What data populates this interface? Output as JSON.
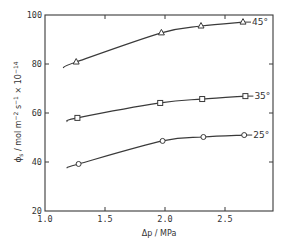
{
  "chart_data": {
    "type": "line",
    "title": "",
    "xlabel": "Δp / MPa",
    "ylabel": "ϕs / mol m⁻² s⁻¹ × 10⁻¹⁴",
    "xlim": [
      1.0,
      2.9
    ],
    "ylim": [
      20,
      100
    ],
    "xticks": [
      1.0,
      1.5,
      2.0,
      2.5
    ],
    "xtick_labels": [
      "1.0",
      "1.5",
      "2.0",
      "2.5"
    ],
    "yticks": [
      20,
      40,
      60,
      80,
      100
    ],
    "ytick_labels": [
      "20",
      "40",
      "60",
      "80",
      "100"
    ],
    "grid": false,
    "legend": "inline labels at right end of each curve",
    "series": [
      {
        "name": "45°",
        "marker": "triangle",
        "x": [
          1.26,
          1.97,
          2.3,
          2.65
        ],
        "values": [
          80.8,
          92.7,
          95.5,
          97.1
        ],
        "curve_start": [
          1.15,
          78.5
        ]
      },
      {
        "name": "35°",
        "marker": "square",
        "x": [
          1.27,
          1.96,
          2.31,
          2.67
        ],
        "values": [
          58.0,
          64.1,
          65.7,
          66.9
        ],
        "curve_start": [
          1.18,
          56.5
        ]
      },
      {
        "name": "25°",
        "marker": "circle",
        "x": [
          1.28,
          1.98,
          2.32,
          2.66
        ],
        "values": [
          39.2,
          48.6,
          50.2,
          51.0
        ],
        "curve_start": [
          1.18,
          37.6
        ]
      }
    ]
  },
  "labels": {
    "xlabel": "Δp / MPa",
    "ylabel_main": "ϕ",
    "ylabel_sub": "s",
    "ylabel_rest": " / mol m",
    "ylabel_exp1": "−2",
    "ylabel_mid": " s",
    "ylabel_exp2": "−1",
    "ylabel_tail": " × 10",
    "ylabel_exp3": "−14"
  }
}
